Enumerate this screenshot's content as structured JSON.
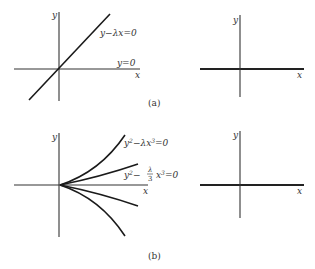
{
  "figure": {
    "panel_a": {
      "caption": "(a)",
      "left_plot": {
        "x_label": "x",
        "y_label": "y",
        "curves": [
          {
            "label": "y−λx=0",
            "kind": "line through origin, positive slope"
          },
          {
            "label": "y=0",
            "kind": "x-axis"
          }
        ]
      },
      "right_plot": {
        "x_label": "x",
        "y_label": "y"
      }
    },
    "panel_b": {
      "caption": "(b)",
      "left_plot": {
        "x_label": "x",
        "y_label": "y",
        "curve_label_1": {
          "base": "y",
          "sup1": "2",
          "mid": "−λx",
          "sup2": "3",
          "end": "=0"
        },
        "curve_label_2": {
          "base": "y",
          "sup1": "2",
          "mid": "−",
          "frac_num": "λ",
          "frac_den": "3",
          "x": "x",
          "sup2": "3",
          "end": "=0"
        }
      },
      "right_plot": {
        "x_label": "x",
        "y_label": "y"
      }
    }
  }
}
